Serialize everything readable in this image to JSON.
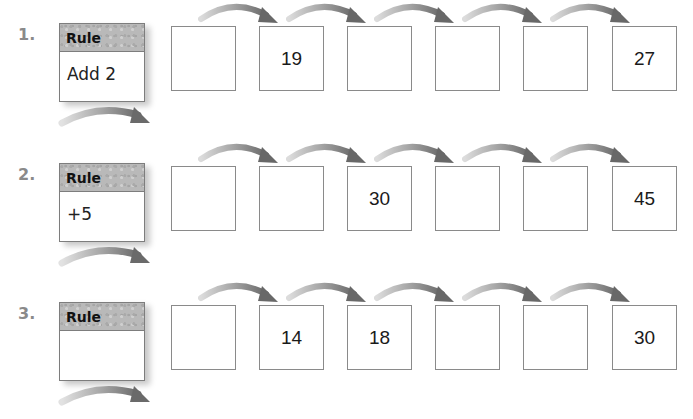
{
  "colors": {
    "arrow_dark": "#6f6f6f",
    "arrow_light": "#d6d6d6",
    "box_border": "#8a8a8a",
    "rule_header": "#b9b9b9",
    "number_label": "#8a8a8a"
  },
  "problems": [
    {
      "number": "1.",
      "rule_header": "Rule",
      "rule_value": "Add 2",
      "boxes": [
        "",
        "19",
        "",
        "",
        "",
        "27"
      ]
    },
    {
      "number": "2.",
      "rule_header": "Rule",
      "rule_value": "+5",
      "boxes": [
        "",
        "",
        "30",
        "",
        "",
        "45"
      ]
    },
    {
      "number": "3.",
      "rule_header": "Rule",
      "rule_value": "",
      "boxes": [
        "",
        "14",
        "18",
        "",
        "",
        "30"
      ]
    }
  ]
}
